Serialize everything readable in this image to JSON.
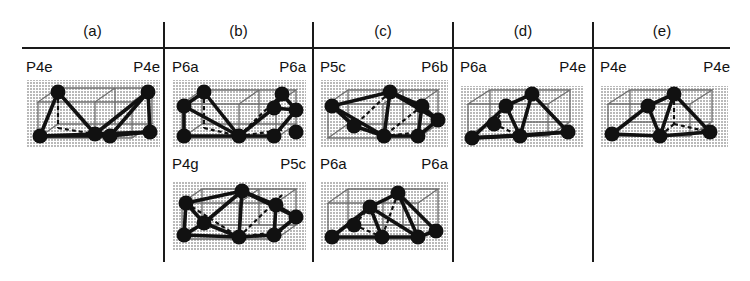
{
  "figure": {
    "title": "",
    "columns": [
      {
        "letter": "(a)"
      },
      {
        "letter": "(b)"
      },
      {
        "letter": "(c)"
      },
      {
        "letter": "(d)"
      },
      {
        "letter": "(e)"
      }
    ],
    "colors": {
      "ink": "#1a1a1a",
      "shading": "#d2d2d2",
      "cell_edge": "#6f6f6f",
      "node_fill": "#111111",
      "bond": "#111111"
    },
    "cells": [
      {
        "id": "a-1",
        "column": "(a)",
        "row": 1,
        "label_left": "P4e",
        "label_right": "P4e",
        "variant": "wide"
      },
      {
        "id": "b-1",
        "column": "(b)",
        "row": 1,
        "label_left": "P6a",
        "label_right": "P6a",
        "variant": "wide"
      },
      {
        "id": "b-2",
        "column": "(b)",
        "row": 2,
        "label_left": "P4g",
        "label_right": "P5c",
        "variant": "wide"
      },
      {
        "id": "c-1",
        "column": "(c)",
        "row": 1,
        "label_left": "P5c",
        "label_right": "P6b",
        "variant": "wide"
      },
      {
        "id": "c-2",
        "column": "(c)",
        "row": 2,
        "label_left": "P6a",
        "label_right": "P6a",
        "variant": "wide"
      },
      {
        "id": "d-1",
        "column": "(d)",
        "row": 1,
        "label_left": "P6a",
        "label_right": "P4e",
        "variant": "narrow"
      },
      {
        "id": "e-1",
        "column": "(e)",
        "row": 1,
        "label_left": "P4e",
        "label_right": "P4e",
        "variant": "narrow"
      }
    ]
  }
}
